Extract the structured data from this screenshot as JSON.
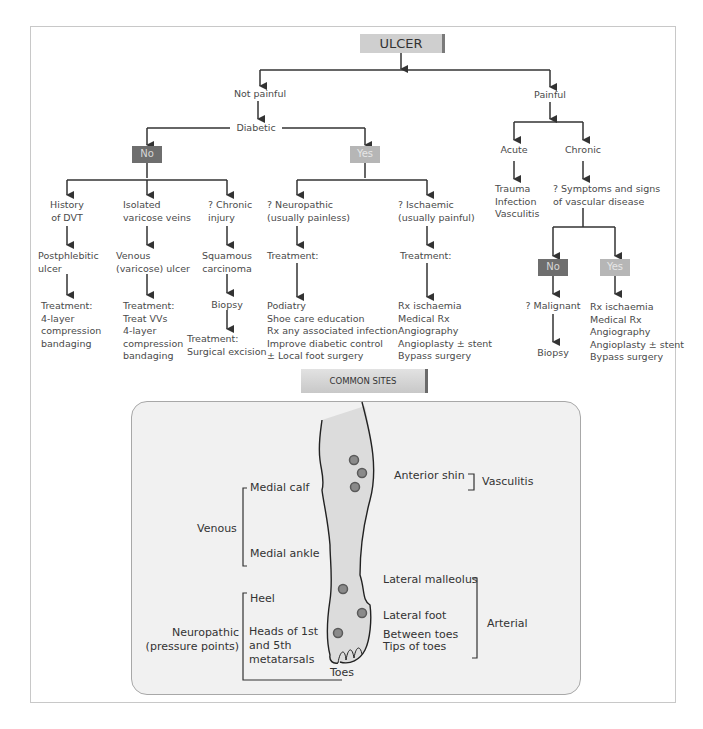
{
  "root": "ULCER",
  "branches": {
    "not_painful": "Not painful",
    "painful": "Painful",
    "diabetic": "Diabetic"
  },
  "diabetic_no": {
    "label": "No",
    "columns": [
      {
        "q": [
          "History",
          "of DVT"
        ],
        "dx": [
          "Postphlebitic",
          "ulcer"
        ],
        "tx": [
          "Treatment:",
          "4-layer",
          "compression",
          "bandaging"
        ]
      },
      {
        "q": [
          "Isolated",
          "varicose veins"
        ],
        "dx": [
          "Venous",
          "(varicose) ulcer"
        ],
        "tx": [
          "Treatment:",
          "Treat VVs",
          "4-layer",
          "compression",
          "bandaging"
        ]
      },
      {
        "q": [
          "? Chronic",
          "injury"
        ],
        "dx": [
          "Squamous",
          "carcinoma"
        ],
        "step": "Biopsy",
        "tx": [
          "Treatment:",
          "Surgical excision"
        ]
      }
    ]
  },
  "diabetic_yes": {
    "label": "Yes",
    "columns": [
      {
        "q": [
          "? Neuropathic",
          "(usually painless)"
        ],
        "t": "Treatment:",
        "tx": [
          "Podiatry",
          "Shoe care education",
          "Rx any associated infection",
          "Improve diabetic control",
          "± Local foot surgery"
        ]
      },
      {
        "q": [
          "? Ischaemic",
          "(usually painful)"
        ],
        "t": "Treatment:",
        "tx": [
          "Rx ischaemia",
          "Medical Rx",
          "Angiography",
          "Angioplasty ± stent",
          "Bypass surgery"
        ]
      }
    ]
  },
  "painful_branch": {
    "acute": "Acute",
    "acute_causes": [
      "Trauma",
      "Infection",
      "Vasculitis"
    ],
    "chronic": "Chronic",
    "chronic_q": [
      "? Symptoms and signs",
      "of vascular disease"
    ],
    "no_label": "No",
    "yes_label": "Yes",
    "no_path": {
      "q": "? Malignant",
      "next": "Biopsy"
    },
    "yes_path": [
      "Rx ischaemia",
      "Medical Rx",
      "Angiography",
      "Angioplasty ± stent",
      "Bypass surgery"
    ]
  },
  "common_sites": {
    "title": "COMMON SITES",
    "venous": {
      "group": "Venous",
      "sites": [
        "Medial calf",
        "Medial ankle"
      ]
    },
    "neuropathic": {
      "group": [
        "Neuropathic",
        "(pressure points)"
      ],
      "sites": [
        "Heel",
        "Heads of 1st",
        "and 5th",
        "metatarsals",
        "Toes"
      ]
    },
    "vasculitis": {
      "group": "Vasculitis",
      "sites": [
        "Anterior shin"
      ]
    },
    "arterial": {
      "group": "Arterial",
      "sites": [
        "Lateral malleolus",
        "Lateral foot",
        "Between toes",
        "Tips of toes"
      ]
    }
  },
  "colors": {
    "no_box": "#6e6e6e",
    "yes_box": "#b6b6b6",
    "root_box": "#cfcfcf",
    "panel_bg": "#f1f1f1",
    "marker": "#8a8a8a"
  }
}
